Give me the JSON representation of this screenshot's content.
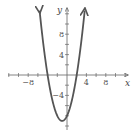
{
  "chart_data": {
    "type": "line",
    "title": "",
    "xlabel": "x",
    "ylabel": "y",
    "function": "y = x^2 + 2x - 8",
    "xlim": [
      -13.5,
      13.5
    ],
    "ylim": [
      -11,
      14
    ],
    "x_tick_step": 2,
    "y_tick_step": 2,
    "x_tick_labels": [
      "-8",
      "4",
      "8"
    ],
    "y_tick_labels": [
      "8",
      "4",
      "-4"
    ],
    "grid": false,
    "legend": null,
    "series": [
      {
        "name": "parabola",
        "color": "#555555",
        "x": [
          -5.6,
          -5,
          -4,
          -3,
          -2,
          -1,
          0,
          1,
          2,
          3,
          3.6
        ],
        "y": [
          12.2,
          7,
          0,
          -5,
          -8,
          -9,
          -8,
          -5,
          0,
          7,
          12.2
        ]
      }
    ],
    "annotations": {
      "vertex": [
        -1,
        -9
      ],
      "x_intercepts": [
        -4,
        2
      ],
      "y_intercept": -8
    }
  },
  "axes": {
    "x_label": "x",
    "y_label": "y",
    "x_ticks": [
      {
        "v": -8,
        "label": "-8"
      },
      {
        "v": 4,
        "label": "4"
      },
      {
        "v": 8,
        "label": "8"
      }
    ],
    "y_ticks": [
      {
        "v": 8,
        "label": "8"
      },
      {
        "v": 4,
        "label": "4"
      },
      {
        "v": -4,
        "label": "-4"
      }
    ]
  }
}
